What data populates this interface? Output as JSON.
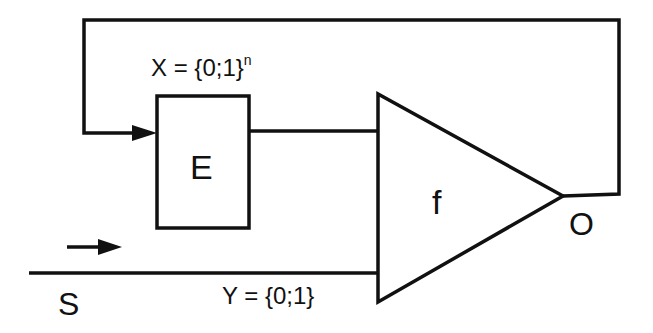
{
  "diagram": {
    "type": "feedback-loop block diagram",
    "colors": {
      "stroke": "#111111",
      "background": "#ffffff"
    },
    "blocks": [
      {
        "id": "E",
        "label": "E",
        "shape": "rectangle"
      },
      {
        "id": "f",
        "label": "f",
        "shape": "triangle"
      }
    ],
    "labels": {
      "x_set_base": "X = {0;1}",
      "x_set_exp": "n",
      "e": "E",
      "f": "f",
      "o": "O",
      "y_set": "Y = {0;1}",
      "s": "S"
    },
    "connections": [
      {
        "from": "O",
        "to": "E",
        "kind": "feedback",
        "arrow": true
      },
      {
        "from": "E",
        "to": "f",
        "kind": "signal"
      },
      {
        "from": "S",
        "to": "f",
        "kind": "input",
        "direction_arrow": true
      }
    ]
  }
}
